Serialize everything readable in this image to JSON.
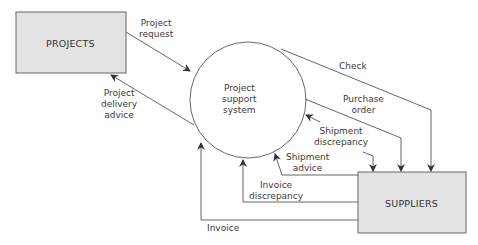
{
  "diagram": {
    "type": "data-flow-diagram",
    "entities": [
      {
        "id": "projects",
        "label": "PROJECTS"
      },
      {
        "id": "suppliers",
        "label": "SUPPLIERS"
      }
    ],
    "process": {
      "id": "pss",
      "label_lines": [
        "Project",
        "support",
        "system"
      ]
    },
    "flows": {
      "project_request": {
        "lines": [
          "Project",
          "request"
        ],
        "from": "projects",
        "to": "pss"
      },
      "project_delivery_advice": {
        "lines": [
          "Project",
          "delivery",
          "advice"
        ],
        "from": "pss",
        "to": "projects"
      },
      "check": {
        "lines": [
          "Check"
        ],
        "from": "pss",
        "to": "suppliers"
      },
      "purchase_order": {
        "lines": [
          "Purchase",
          "order"
        ],
        "from": "pss",
        "to": "suppliers"
      },
      "shipment_discrepancy": {
        "lines": [
          "Shipment",
          "discrepancy"
        ],
        "from": "pss",
        "to": "suppliers"
      },
      "shipment_advice": {
        "lines": [
          "Shipment",
          "advice"
        ],
        "from": "suppliers",
        "to": "pss"
      },
      "invoice_discrepancy": {
        "lines": [
          "Invoice",
          "discrepancy"
        ],
        "from": "suppliers",
        "to": "pss"
      },
      "invoice": {
        "lines": [
          "Invoice"
        ],
        "from": "suppliers",
        "to": "pss"
      }
    },
    "colors": {
      "box_fill": "#e3e3e3",
      "line": "#555555",
      "text": "#3a3a3a"
    }
  }
}
